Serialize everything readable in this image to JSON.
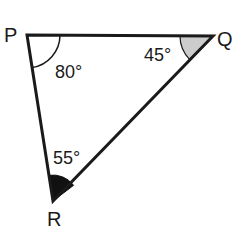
{
  "diagram": {
    "type": "triangle",
    "vertices": [
      {
        "name": "P",
        "x": 27,
        "y": 35
      },
      {
        "name": "Q",
        "x": 213,
        "y": 36
      },
      {
        "name": "R",
        "x": 53,
        "y": 201
      }
    ],
    "angles": [
      {
        "vertex": "P",
        "label": "80°",
        "marker": "arc"
      },
      {
        "vertex": "Q",
        "label": "45°",
        "marker": "gray-sector"
      },
      {
        "vertex": "R",
        "label": "55°",
        "marker": "black-sector"
      }
    ],
    "colors": {
      "stroke": "#1a1a1a",
      "q_fill": "#cccccc",
      "r_fill": "#111111"
    }
  }
}
